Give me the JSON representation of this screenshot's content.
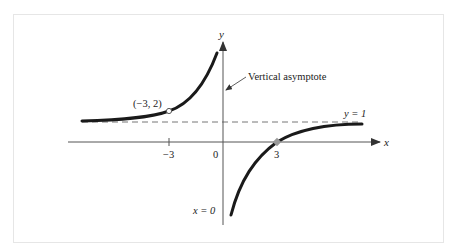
{
  "figure": {
    "function": "y = (x - 3) / x",
    "axes": {
      "x_label": "x",
      "y_label": "y"
    },
    "ticks": {
      "x": [
        "−3",
        "0",
        "3"
      ]
    },
    "labels": {
      "point": "(−3, 2)",
      "vertical_asymptote_callout": "Vertical asymptote",
      "horizontal_asymptote": "y = 1",
      "vertical_asymptote_eq": "x = 0"
    },
    "points": [
      {
        "x": -3,
        "y": 2,
        "style": "open-circle"
      },
      {
        "x": 3,
        "y": 0,
        "style": "x-intercept"
      }
    ],
    "asymptotes": {
      "vertical": "x = 0",
      "horizontal": "y = 1"
    },
    "colors": {
      "curve": "#1a1a1a",
      "axis": "#555555",
      "dashed": "#777777",
      "frame": "#e6e6e6"
    }
  }
}
